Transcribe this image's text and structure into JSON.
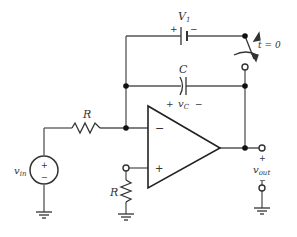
{
  "diagram": {
    "type": "op-amp integrator circuit with initial-condition switch",
    "labels": {
      "battery": "V",
      "battery_sub": "1",
      "battery_plus": "+",
      "battery_minus": "−",
      "switch_time": "t = 0",
      "capacitor": "C",
      "cap_plus": "+",
      "cap_voltage": "v",
      "cap_voltage_sub": "C",
      "cap_minus": "−",
      "input_resistor": "R",
      "ground_resistor": "R",
      "source": "v",
      "source_sub": "in",
      "source_plus": "+",
      "source_minus": "−",
      "opamp_inv": "−",
      "opamp_noninv": "+",
      "out_plus": "+",
      "output": "v",
      "output_sub": "out",
      "out_minus": "−"
    },
    "colors": {
      "wire": "#555555",
      "opamp": "#222222"
    }
  }
}
